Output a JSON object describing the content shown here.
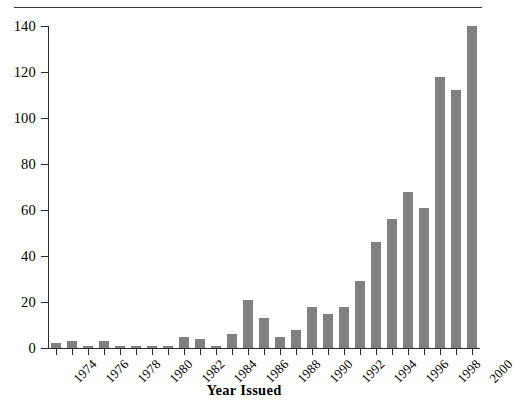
{
  "chart_data": {
    "type": "bar",
    "title": "",
    "xlabel": "Year Issued",
    "ylabel": "",
    "ylim": [
      0,
      140
    ],
    "yticks": [
      0,
      20,
      40,
      60,
      80,
      100,
      120,
      140
    ],
    "grid": false,
    "legend": null,
    "bar_color": "#808080",
    "axis_color": "#2c2c2c",
    "xtick_labels_every": 2,
    "categories": [
      "1974",
      "1975",
      "1976",
      "1977",
      "1978",
      "1979",
      "1980",
      "1981",
      "1982",
      "1983",
      "1984",
      "1985",
      "1986",
      "1987",
      "1988",
      "1989",
      "1990",
      "1991",
      "1992",
      "1993",
      "1994",
      "1995",
      "1996",
      "1997",
      "1998",
      "1999",
      "2000"
    ],
    "visible_xtick_labels": [
      "1974",
      "1976",
      "1978",
      "1980",
      "1982",
      "1984",
      "1986",
      "1988",
      "1990",
      "1992",
      "1994",
      "1996",
      "1998",
      "2000"
    ],
    "values": [
      2,
      3,
      1,
      3,
      1,
      1,
      1,
      1,
      5,
      4,
      1,
      6,
      21,
      13,
      5,
      8,
      18,
      15,
      18,
      29,
      46,
      56,
      68,
      61,
      118,
      112,
      140
    ]
  },
  "figure": {
    "top_rule": "horizontal-rule",
    "axis_title": "Year Issued"
  }
}
